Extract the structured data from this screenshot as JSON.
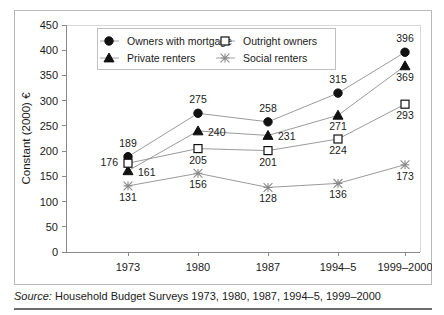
{
  "chart_data": {
    "type": "line",
    "title": "",
    "xlabel": "",
    "ylabel": "Constant (2000) €",
    "categories": [
      "1973",
      "1980",
      "1987",
      "1994–5",
      "1999–2000"
    ],
    "ylim": [
      0,
      450
    ],
    "ytick_step": 50,
    "yticks": [
      "0",
      "50",
      "100",
      "150",
      "200",
      "250",
      "300",
      "350",
      "400",
      "450"
    ],
    "grid": false,
    "legend_position": "top-center",
    "series": [
      {
        "name": "Owners with mortgage",
        "marker": "filled-circle",
        "values": [
          189,
          275,
          258,
          315,
          396
        ],
        "labels": [
          "189",
          "275",
          "258",
          "315",
          "396"
        ],
        "label_positions": [
          "above",
          "above",
          "above",
          "above",
          "above"
        ]
      },
      {
        "name": "Private renters",
        "marker": "filled-triangle",
        "values": [
          161,
          240,
          231,
          271,
          369
        ],
        "labels": [
          "161",
          "240",
          "231",
          "271",
          "369"
        ],
        "label_positions": [
          "right",
          "right",
          "right",
          "below",
          "below"
        ]
      },
      {
        "name": "Outright owners",
        "marker": "open-square",
        "values": [
          176,
          205,
          201,
          224,
          293
        ],
        "labels": [
          "176",
          "205",
          "201",
          "224",
          "293"
        ],
        "label_positions": [
          "left",
          "below",
          "below",
          "below",
          "below"
        ]
      },
      {
        "name": "Social renters",
        "marker": "cross-x",
        "values": [
          131,
          156,
          128,
          136,
          173
        ],
        "labels": [
          "131",
          "156",
          "128",
          "136",
          "173"
        ],
        "label_positions": [
          "below",
          "below",
          "below",
          "below",
          "below"
        ]
      }
    ]
  },
  "source": {
    "prefix": "Source:",
    "text": "Household Budget Surveys 1973, 1980, 1987, 1994–5, 1999–2000"
  },
  "colors": {
    "ink": "#1a1a1a",
    "line": "#8e8e8e",
    "axis": "#8a8a8a",
    "frame": "#d8d8d8",
    "rule": "#6d6d6d",
    "background": "#ffffff"
  }
}
